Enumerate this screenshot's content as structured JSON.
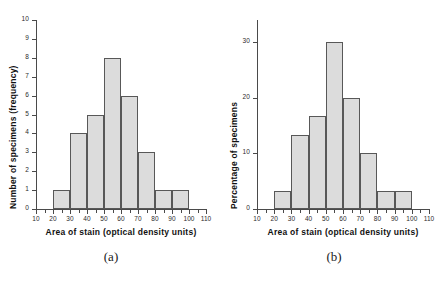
{
  "figure": {
    "panels": [
      {
        "caption": "(a)",
        "chart_data": {
          "type": "bar",
          "title": "",
          "subtitle": "",
          "xlabel": "Area of stain (optical density units)",
          "ylabel": "Number of specimens (frequency)",
          "xlim": [
            10,
            110
          ],
          "ylim": [
            0,
            10
          ],
          "grid": false,
          "legend": "none",
          "xticks": [
            10,
            20,
            30,
            40,
            50,
            60,
            70,
            80,
            90,
            100,
            110
          ],
          "xtick_labels": [
            "10",
            "20",
            "30",
            "40",
            "50",
            "60",
            "70",
            "80",
            "90",
            "100",
            "110"
          ],
          "x_minor_tick_step": 5,
          "yticks": [
            0,
            1,
            2,
            3,
            4,
            5,
            6,
            7,
            8,
            9,
            10
          ],
          "ytick_labels": [
            "0",
            "1",
            "2",
            "3",
            "4",
            "5",
            "6",
            "7",
            "8",
            "9",
            "10"
          ],
          "bin_edges": [
            20,
            30,
            40,
            50,
            60,
            70,
            80,
            90,
            100
          ],
          "categories": [
            "20-30",
            "30-40",
            "40-50",
            "50-60",
            "60-70",
            "70-80",
            "80-90",
            "90-100"
          ],
          "values": [
            1,
            4,
            5,
            8,
            6,
            3,
            1,
            1
          ],
          "bar_fill": "#dcdcdc",
          "bar_edge": "#585858",
          "total": 30
        }
      },
      {
        "caption": "(b)",
        "chart_data": {
          "type": "bar",
          "title": "",
          "subtitle": "",
          "xlabel": "Area of stain (optical density units)",
          "ylabel": "Percentage of specimens",
          "xlim": [
            10,
            110
          ],
          "ylim": [
            0,
            34
          ],
          "grid": false,
          "legend": "none",
          "xticks": [
            10,
            20,
            30,
            40,
            50,
            60,
            70,
            80,
            90,
            100,
            110
          ],
          "xtick_labels": [
            "10",
            "20",
            "30",
            "40",
            "50",
            "60",
            "70",
            "80",
            "90",
            "100",
            "110"
          ],
          "x_minor_tick_step": 5,
          "yticks": [
            0,
            10,
            20,
            30
          ],
          "ytick_labels": [
            "0",
            "10",
            "20",
            "30"
          ],
          "bin_edges": [
            20,
            30,
            40,
            50,
            60,
            70,
            80,
            90,
            100
          ],
          "categories": [
            "20-30",
            "30-40",
            "40-50",
            "50-60",
            "60-70",
            "70-80",
            "80-90",
            "90-100"
          ],
          "values": [
            3.3,
            13.3,
            16.7,
            30,
            20,
            10,
            3.3,
            3.3
          ],
          "bar_fill": "#dcdcdc",
          "bar_edge": "#585858",
          "total": 100
        }
      }
    ]
  }
}
